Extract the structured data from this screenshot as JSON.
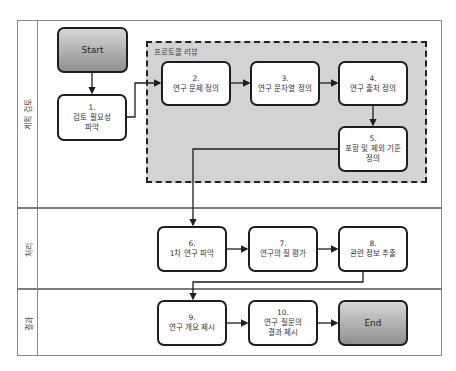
{
  "lanes": [
    {
      "label": "계획 검토"
    },
    {
      "label": "처리"
    },
    {
      "label": "결과"
    }
  ],
  "group": {
    "title": "프로토콜 리뷰"
  },
  "start": {
    "label": "Start"
  },
  "end": {
    "label": "End"
  },
  "steps": [
    {
      "num": "1.",
      "text": "검토 필요성",
      "text2": "파악"
    },
    {
      "num": "2.",
      "text": "연구 문제 정의",
      "text2": ""
    },
    {
      "num": "3.",
      "text": "연구 문자열 정의",
      "text2": ""
    },
    {
      "num": "4.",
      "text": "연구 출처 정의",
      "text2": ""
    },
    {
      "num": "5.",
      "text": "포함 및 제외 기준",
      "text2": "정의"
    },
    {
      "num": "6.",
      "text": "1차 연구 파악",
      "text2": ""
    },
    {
      "num": "7.",
      "text": "연구의 질 평가",
      "text2": ""
    },
    {
      "num": "8.",
      "text": "관련 정보 추출",
      "text2": ""
    },
    {
      "num": "9.",
      "text": "연구 개요 제시",
      "text2": ""
    },
    {
      "num": "10.",
      "text": "연구 질문의",
      "text2": "결과 제시"
    }
  ],
  "colors": {
    "group_fill": "#d3d3d3",
    "border": "#1e1e1e",
    "terminal_top": "#d6d6d6",
    "terminal_bottom": "#8f8f8f"
  }
}
